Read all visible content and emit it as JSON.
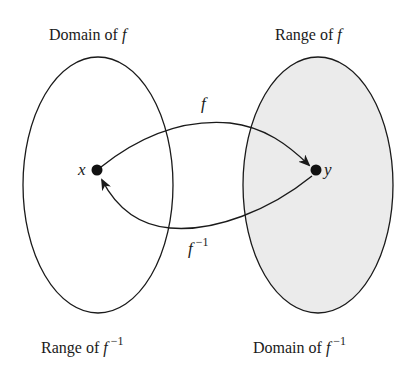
{
  "diagram": {
    "type": "function-inverse-mapping",
    "colors": {
      "stroke": "#1a1a1a",
      "left_fill": "#ffffff",
      "right_fill": "#ebebeb"
    },
    "labels": {
      "top_left_text": "Domain of ",
      "top_left_func": "f",
      "top_right_text": "Range of ",
      "top_right_func": "f",
      "bottom_left_text": "Range of ",
      "bottom_left_func": "f",
      "bottom_left_sup": "−1",
      "bottom_right_text": "Domain of ",
      "bottom_right_func": "f",
      "bottom_right_sup": "−1"
    },
    "points": {
      "left": "x",
      "right": "y"
    },
    "arrows": {
      "forward_label": "f",
      "inverse_label": "f",
      "inverse_sup": "−1"
    }
  }
}
